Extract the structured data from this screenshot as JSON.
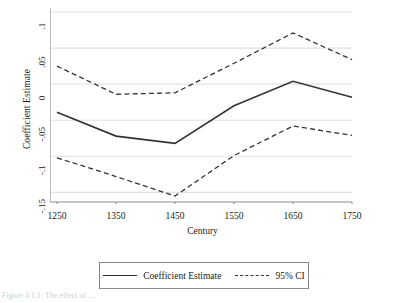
{
  "figure": {
    "caption_partial": "Figure 4.1.1: The effect of ..."
  },
  "chart_data": {
    "type": "line",
    "title": "",
    "xlabel": "Century",
    "ylabel": "Coefficient Estimate",
    "categories": [
      "1250",
      "1350",
      "1450",
      "1550",
      "1650",
      "1750"
    ],
    "x": [
      1250,
      1350,
      1450,
      1550,
      1650,
      1750
    ],
    "xlim": [
      1250,
      1750
    ],
    "ylim": [
      -0.155,
      0.1
    ],
    "ytick_labels": [
      ".1",
      ".05",
      "0",
      "-.05",
      "-.1",
      "-.15"
    ],
    "ytick_values": [
      0.1,
      0.05,
      0,
      -0.05,
      -0.1,
      -0.15
    ],
    "xtick_labels": [
      "1250",
      "1350",
      "1450",
      "1550",
      "1650",
      "1750"
    ],
    "grid": "horizontal",
    "legend_position": "bottom-center",
    "series": [
      {
        "name": "Coefficient Estimate",
        "style": "solid",
        "color": "#333333",
        "values": [
          -0.039,
          -0.072,
          -0.082,
          -0.03,
          0.004,
          -0.018
        ]
      },
      {
        "name": "95% CI upper",
        "style": "dashed",
        "color": "#333333",
        "values": [
          0.025,
          -0.014,
          -0.012,
          0.029,
          0.071,
          0.034
        ]
      },
      {
        "name": "95% CI lower",
        "style": "dashed",
        "color": "#333333",
        "values": [
          -0.102,
          -0.128,
          -0.155,
          -0.099,
          -0.058,
          -0.071
        ]
      }
    ],
    "legend": [
      {
        "label": "Coefficient Estimate",
        "style": "solid"
      },
      {
        "label": "95% CI",
        "style": "dashed"
      }
    ]
  },
  "axes": {
    "y_title": "Coefficient Estimate",
    "x_title": "Century"
  }
}
